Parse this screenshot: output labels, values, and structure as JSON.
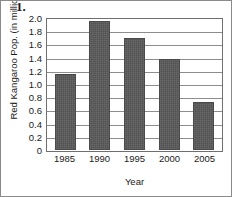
{
  "problem": {
    "number": "1."
  },
  "chart_data": {
    "type": "bar",
    "title": "",
    "xlabel": "Year",
    "ylabel": "Red Kangaroo Pop. (in millions)",
    "categories": [
      "1985",
      "1990",
      "1995",
      "2000",
      "2005"
    ],
    "values": [
      1.15,
      1.95,
      1.7,
      1.375,
      0.72
    ],
    "ylim": [
      0,
      2.0
    ],
    "ytick_step": 0.2,
    "ytick_labels": [
      "2.0",
      "1.8",
      "1.6",
      "1.4",
      "1.2",
      "1.0",
      "0.8",
      "0.6",
      "0.4",
      "0.2",
      "0"
    ],
    "ytick_values": [
      2.0,
      1.8,
      1.6,
      1.4,
      1.2,
      1.0,
      0.8,
      0.6,
      0.4,
      0.2,
      0
    ],
    "grid": "horizontal",
    "legend": "none",
    "bar_color": "#595959",
    "grid_color": "#8d8d8d",
    "axis_color": "#6f6f6f"
  }
}
